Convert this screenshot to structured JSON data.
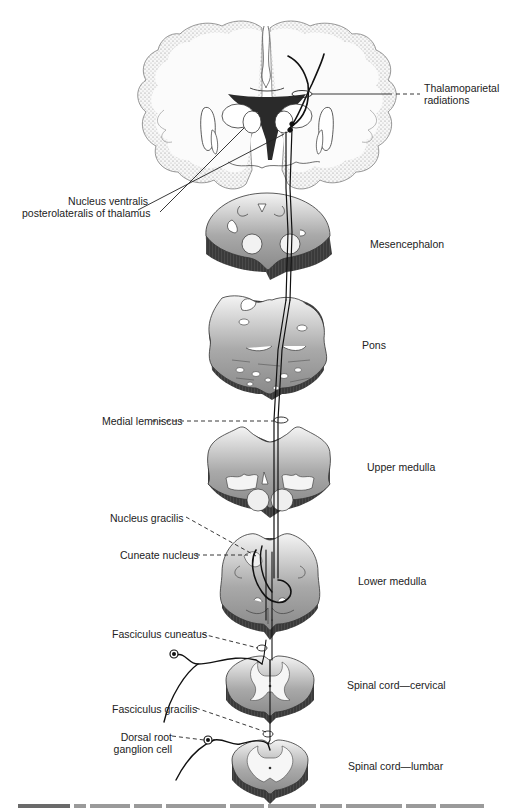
{
  "figure": {
    "levels": [
      {
        "key": "cerebrum",
        "label": ""
      },
      {
        "key": "mesencephalon",
        "label": "Mesencephalon"
      },
      {
        "key": "pons",
        "label": "Pons"
      },
      {
        "key": "upper_medulla",
        "label": "Upper medulla"
      },
      {
        "key": "lower_medulla",
        "label": "Lower medulla"
      },
      {
        "key": "cervical",
        "label": "Spinal cord—cervical"
      },
      {
        "key": "lumbar",
        "label": "Spinal cord—lumbar"
      }
    ],
    "annotations": {
      "thalamoparietal_1": "Thalamoparietal",
      "thalamoparietal_2": "radiations",
      "nvpl_1": "Nucleus ventralis",
      "nvpl_2": "posterolateralis of thalamus",
      "medial_lemniscus": "Medial lemniscus",
      "nucleus_gracilis": "Nucleus gracilis",
      "cuneate_nucleus": "Cuneate nucleus",
      "fasciculus_cuneatus": "Fasciculus cuneatus",
      "fasciculus_gracilis": "Fasciculus gracilis",
      "drg_1": "Dorsal root",
      "drg_2": "ganglion cell"
    },
    "colors": {
      "section_fill_light": "#f2f2f2",
      "section_fill_dark": "#9b9b9b",
      "edge_dark": "#3a3a3a",
      "stipple": "#8a8a8a",
      "ventricle": "#2a2a2a"
    }
  }
}
